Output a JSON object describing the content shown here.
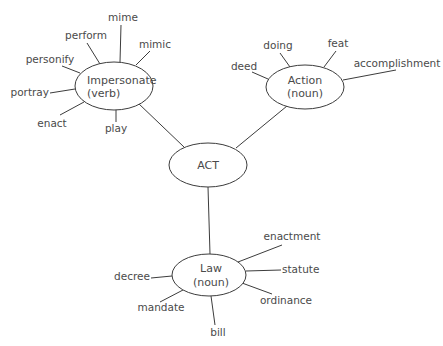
{
  "diagram": {
    "center": {
      "id": "act",
      "lines": [
        "ACT"
      ]
    },
    "nodes": [
      {
        "id": "impersonate",
        "lines": [
          "Impersonate",
          "(verb)"
        ],
        "words": [
          "mime",
          "perform",
          "mimic",
          "personify",
          "portray",
          "enact",
          "play"
        ]
      },
      {
        "id": "action",
        "lines": [
          "Action",
          "(noun)"
        ],
        "words": [
          "doing",
          "feat",
          "deed",
          "accomplishment"
        ]
      },
      {
        "id": "law",
        "lines": [
          "Law",
          "(noun)"
        ],
        "words": [
          "enactment",
          "statute",
          "decree",
          "ordinance",
          "mandate",
          "bill"
        ]
      }
    ],
    "edges": [
      {
        "from": "act",
        "to": "impersonate"
      },
      {
        "from": "act",
        "to": "action"
      },
      {
        "from": "act",
        "to": "law"
      }
    ],
    "colors": {
      "text": "#4a4a4a",
      "line": "#3c3c3c",
      "background": "#ffffff"
    }
  }
}
